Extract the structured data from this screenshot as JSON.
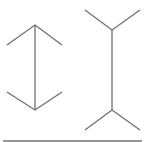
{
  "diagram": {
    "stroke_color": "#707070",
    "figures": [
      {
        "name": "arrowheads-inward",
        "shaft": [
          35,
          25,
          35,
          110
        ]
      },
      {
        "name": "fins-outward",
        "shaft": [
          112,
          30,
          112,
          110
        ]
      }
    ],
    "baseline": [
      3,
      141,
      142,
      141
    ]
  }
}
